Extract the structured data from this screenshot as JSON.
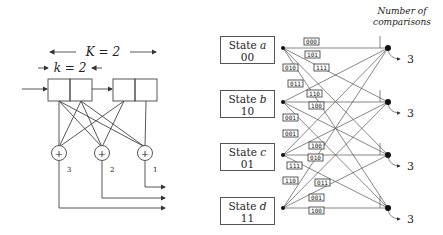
{
  "encoder": {
    "constraint_label": "K = 2",
    "k_label": "k = 2",
    "adders": [
      {
        "symbol": "+",
        "output_index": "3"
      },
      {
        "symbol": "+",
        "output_index": "2"
      },
      {
        "symbol": "+",
        "output_index": "1"
      }
    ]
  },
  "trellis": {
    "header": {
      "line1": "Number of",
      "line2": "comparisons"
    },
    "states": [
      {
        "prefix": "State",
        "letter": "a",
        "bits": "00",
        "comparisons": "3"
      },
      {
        "prefix": "State",
        "letter": "b",
        "bits": "10",
        "comparisons": "3"
      },
      {
        "prefix": "State",
        "letter": "c",
        "bits": "01",
        "comparisons": "3"
      },
      {
        "prefix": "State",
        "letter": "d",
        "bits": "11",
        "comparisons": "3"
      }
    ],
    "branch_labels": [
      {
        "text": "000",
        "x": 305,
        "y": 44
      },
      {
        "text": "101",
        "x": 306,
        "y": 57
      },
      {
        "text": "010",
        "x": 284,
        "y": 70
      },
      {
        "text": "111",
        "x": 315,
        "y": 70
      },
      {
        "text": "011",
        "x": 289,
        "y": 86
      },
      {
        "text": "110",
        "x": 308,
        "y": 96
      },
      {
        "text": "100",
        "x": 310,
        "y": 108
      },
      {
        "text": "001",
        "x": 284,
        "y": 120
      },
      {
        "text": "001",
        "x": 284,
        "y": 136
      },
      {
        "text": "100",
        "x": 310,
        "y": 148
      },
      {
        "text": "010",
        "x": 309,
        "y": 160
      },
      {
        "text": "111",
        "x": 288,
        "y": 168
      },
      {
        "text": "110",
        "x": 284,
        "y": 183
      },
      {
        "text": "011",
        "x": 316,
        "y": 185
      },
      {
        "text": "001",
        "x": 310,
        "y": 200
      },
      {
        "text": "100",
        "x": 310,
        "y": 213
      }
    ]
  }
}
